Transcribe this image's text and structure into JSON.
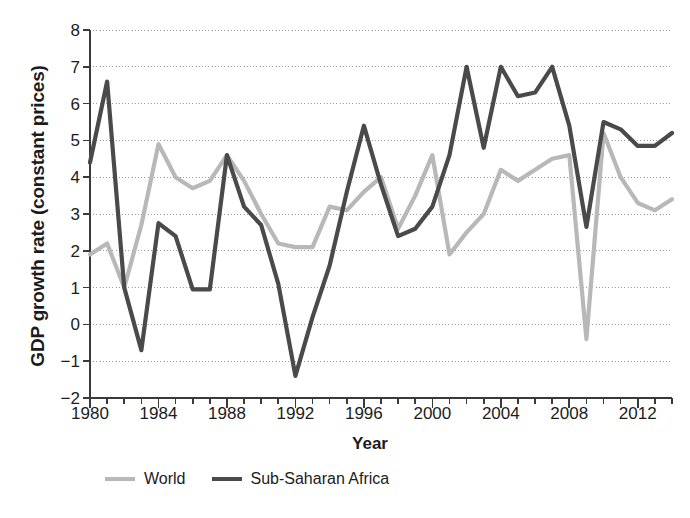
{
  "chart_data": {
    "type": "line",
    "title": "",
    "subtitle": "",
    "xlabel": "Year",
    "ylabel": "GDP growth rate (constant prices)",
    "xlim": [
      1980,
      2014
    ],
    "ylim": [
      -2,
      8
    ],
    "grid": true,
    "legend_position": "bottom-left",
    "x": [
      1980,
      1981,
      1982,
      1983,
      1984,
      1985,
      1986,
      1987,
      1988,
      1989,
      1990,
      1991,
      1992,
      1993,
      1994,
      1995,
      1996,
      1997,
      1998,
      1999,
      2000,
      2001,
      2002,
      2003,
      2004,
      2005,
      2006,
      2007,
      2008,
      2009,
      2010,
      2011,
      2012,
      2013,
      2014
    ],
    "xticks": [
      1980,
      1984,
      1988,
      1992,
      1996,
      2000,
      2004,
      2008,
      2012
    ],
    "xtick_labels": [
      "1980",
      "1984",
      "1988",
      "1992",
      "1996",
      "2000",
      "2004",
      "2008",
      "2012"
    ],
    "yticks": [
      -2,
      -1,
      0,
      1,
      2,
      3,
      4,
      5,
      6,
      7,
      8
    ],
    "ytick_labels": [
      "−2",
      "−1",
      "0",
      "1",
      "2",
      "3",
      "4",
      "5",
      "6",
      "7",
      "8"
    ],
    "series": [
      {
        "name": "World",
        "color": "#b8b8b8",
        "width": 4.2,
        "values": [
          1.9,
          2.2,
          1.0,
          2.7,
          4.9,
          4.0,
          3.7,
          3.9,
          4.6,
          3.9,
          3.0,
          2.2,
          2.1,
          2.1,
          3.2,
          3.1,
          3.6,
          4.0,
          2.6,
          3.5,
          4.6,
          1.9,
          2.5,
          3.0,
          4.2,
          3.9,
          4.2,
          4.5,
          4.6,
          -0.4,
          5.2,
          4.0,
          3.3,
          3.1,
          3.4
        ]
      },
      {
        "name": "Sub-Saharan Africa",
        "color": "#4a4a4a",
        "width": 4.2,
        "values": [
          4.4,
          6.6,
          1.0,
          -0.7,
          2.75,
          2.4,
          0.95,
          0.95,
          4.6,
          3.2,
          2.7,
          1.1,
          -1.4,
          0.2,
          1.6,
          3.6,
          5.4,
          3.8,
          2.4,
          2.6,
          3.2,
          4.6,
          7.0,
          4.8,
          7.0,
          6.2,
          6.3,
          7.0,
          5.4,
          2.65,
          5.5,
          5.3,
          4.85,
          4.85,
          5.2
        ]
      }
    ]
  },
  "axis": {
    "ylabel": "GDP growth rate (constant prices)",
    "xlabel": "Year"
  },
  "legend": {
    "items": [
      {
        "label": "World",
        "color": "#b8b8b8"
      },
      {
        "label": "Sub-Saharan Africa",
        "color": "#4a4a4a"
      }
    ]
  }
}
